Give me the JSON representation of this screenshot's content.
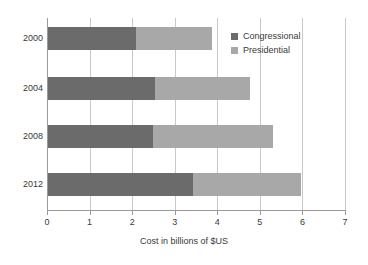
{
  "chart_data": {
    "type": "bar",
    "orientation": "horizontal",
    "stacked": true,
    "title": "",
    "xlabel": "Cost in billions of $US",
    "ylabel": "",
    "categories": [
      "2000",
      "2004",
      "2008",
      "2012"
    ],
    "series": [
      {
        "name": "Congressional",
        "color": "#6b6b6b",
        "values": [
          2.1,
          2.54,
          2.5,
          3.44
        ]
      },
      {
        "name": "Presidential",
        "color": "#a8a8a8",
        "values": [
          1.78,
          2.24,
          2.8,
          2.53
        ]
      }
    ],
    "totals": [
      3.88,
      4.78,
      5.3,
      5.97
    ],
    "xlim": [
      0,
      7
    ],
    "xticks": [
      0,
      1,
      2,
      3,
      4,
      5,
      6,
      7
    ],
    "xtick_labels": [
      "0",
      "1",
      "2",
      "3",
      "4",
      "5",
      "6",
      "7"
    ],
    "grid": "vertical",
    "legend_position": "top-right",
    "legend_entries": [
      "Congressional",
      "Presidential"
    ]
  },
  "colors": {
    "congressional": "#6b6b6b",
    "presidential": "#a8a8a8",
    "grid": "#c9c9c9",
    "axis": "#9a9a9a",
    "text": "#3a3a3a",
    "background": "#ffffff"
  }
}
